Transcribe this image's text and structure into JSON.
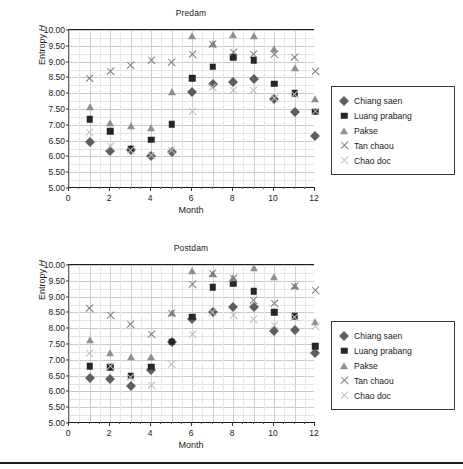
{
  "figure": {
    "legend_entries": [
      {
        "label": "Chiang saen",
        "marker": "diamond",
        "color": "#5e5e5e"
      },
      {
        "label": "Luang prabang",
        "marker": "square",
        "color": "#262626"
      },
      {
        "label": "Pakse",
        "marker": "triangle",
        "color": "#8f8f8f"
      },
      {
        "label": "Tan chaou",
        "marker": "cross",
        "color": "#7a7a7a"
      },
      {
        "label": "Chao doc",
        "marker": "cross-light",
        "color": "#bdbdbd"
      }
    ]
  },
  "chart_data": [
    {
      "type": "scatter",
      "title": "Predam",
      "xlabel": "Month",
      "ylabel": "Entropy H",
      "xlim": [
        0,
        12
      ],
      "ylim": [
        5.0,
        10.0
      ],
      "ytick_labels": [
        "10.00",
        "9.50",
        "9.00",
        "8.50",
        "8.00",
        "7.50",
        "7.00",
        "6.50",
        "6.00",
        "5.50",
        "5.00"
      ],
      "ytick_values": [
        10.0,
        9.5,
        9.0,
        8.5,
        8.0,
        7.5,
        7.0,
        6.5,
        6.0,
        5.5,
        5.0
      ],
      "xtick_labels": [
        "0",
        "2",
        "4",
        "6",
        "8",
        "10",
        "12"
      ],
      "xtick_values": [
        0,
        2,
        4,
        6,
        8,
        10,
        12
      ],
      "grid": true,
      "legend_position": "right-outside",
      "x": [
        1,
        2,
        3,
        4,
        5,
        6,
        7,
        8,
        9,
        10,
        11,
        12
      ],
      "series": [
        {
          "name": "Chiang saen",
          "marker": "diamond",
          "values": [
            6.45,
            6.18,
            6.2,
            6.02,
            6.15,
            8.03,
            8.28,
            8.37,
            8.44,
            7.83,
            7.4,
            6.63
          ]
        },
        {
          "name": "Luang prabang",
          "marker": "square",
          "values": [
            7.17,
            6.8,
            6.25,
            6.52,
            7.02,
            8.47,
            8.84,
            9.13,
            9.04,
            8.3,
            8.0,
            7.42
          ]
        },
        {
          "name": "Pakse",
          "marker": "triangle",
          "values": [
            7.55,
            7.05,
            6.97,
            6.9,
            8.03,
            9.8,
            9.55,
            9.83,
            9.82,
            9.4,
            8.8,
            7.82
          ]
        },
        {
          "name": "Tan chaou",
          "marker": "cross",
          "values": [
            8.45,
            8.7,
            8.87,
            9.02,
            8.98,
            9.22,
            9.55,
            9.28,
            9.23,
            9.22,
            9.12,
            8.68
          ]
        },
        {
          "name": "Chao doc",
          "marker": "cross-light",
          "values": [
            6.77,
            6.32,
            6.18,
            6.03,
            6.18,
            7.42,
            8.18,
            8.08,
            8.08,
            7.83,
            7.95,
            7.42
          ]
        }
      ]
    },
    {
      "type": "scatter",
      "title": "Postdam",
      "xlabel": "Month",
      "ylabel": "Entropy H",
      "xlim": [
        0,
        12
      ],
      "ylim": [
        5.0,
        10.0
      ],
      "ytick_labels": [
        "10.00",
        "9.50",
        "9.00",
        "8.50",
        "8.00",
        "7.50",
        "7.00",
        "6.50",
        "6.00",
        "5.50",
        "5.00"
      ],
      "ytick_values": [
        10.0,
        9.5,
        9.0,
        8.5,
        8.0,
        7.5,
        7.0,
        6.5,
        6.0,
        5.5,
        5.0
      ],
      "xtick_labels": [
        "0",
        "2",
        "4",
        "6",
        "8",
        "10",
        "12"
      ],
      "xtick_values": [
        0,
        2,
        4,
        6,
        8,
        10,
        12
      ],
      "grid": true,
      "legend_position": "right-outside",
      "x": [
        1,
        2,
        3,
        4,
        5,
        6,
        7,
        8,
        9,
        10,
        11,
        12
      ],
      "series": [
        {
          "name": "Chiang saen",
          "marker": "diamond",
          "values": [
            6.44,
            6.38,
            6.16,
            6.68,
            7.55,
            8.3,
            8.5,
            8.67,
            8.68,
            7.9,
            7.95,
            7.22
          ]
        },
        {
          "name": "Luang prabang",
          "marker": "square",
          "values": [
            6.8,
            6.76,
            6.5,
            6.78,
            7.57,
            8.37,
            9.3,
            9.43,
            9.17,
            8.5,
            8.38,
            7.43
          ]
        },
        {
          "name": "Pakse",
          "marker": "triangle",
          "values": [
            7.63,
            7.22,
            7.1,
            7.1,
            8.47,
            9.8,
            9.72,
            9.6,
            9.92,
            9.63,
            9.32,
            8.2
          ]
        },
        {
          "name": "Tan chaou",
          "marker": "cross",
          "values": [
            8.63,
            8.4,
            8.13,
            7.8,
            8.45,
            9.37,
            9.73,
            9.58,
            8.88,
            8.78,
            9.32,
            9.18
          ]
        },
        {
          "name": "Chao doc",
          "marker": "cross-light",
          "values": [
            7.2,
            6.78,
            6.45,
            6.18,
            6.85,
            7.8,
            8.5,
            8.4,
            8.27,
            8.08,
            8.35,
            8.05
          ]
        }
      ]
    }
  ]
}
